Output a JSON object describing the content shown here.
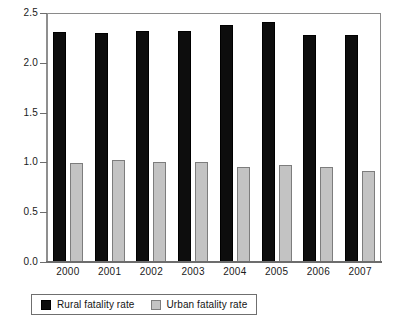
{
  "chart_data": {
    "type": "bar",
    "title": "",
    "subtitle": "",
    "xlabel": "",
    "ylabel": "",
    "categories": [
      "2000",
      "2001",
      "2002",
      "2003",
      "2004",
      "2005",
      "2006",
      "2007"
    ],
    "series": [
      {
        "name": "Rural fatality rate",
        "color": "#0d0d0d",
        "values": [
          2.31,
          2.3,
          2.32,
          2.32,
          2.38,
          2.41,
          2.28,
          2.28
        ]
      },
      {
        "name": "Urban fatality rate",
        "color": "#c3c3c3",
        "values": [
          0.99,
          1.02,
          1.0,
          1.0,
          0.95,
          0.97,
          0.95,
          0.91
        ]
      }
    ],
    "ylim": [
      0.0,
      2.5
    ],
    "ytick_labels": [
      "0.0",
      "0.5",
      "1.0",
      "1.5",
      "2.0",
      "2.5"
    ],
    "ytick_values": [
      0.0,
      0.5,
      1.0,
      1.5,
      2.0,
      2.5
    ],
    "grid": false,
    "legend_position": "bottom",
    "legend": [
      "Rural fatality rate",
      "Urban fatality rate"
    ]
  }
}
